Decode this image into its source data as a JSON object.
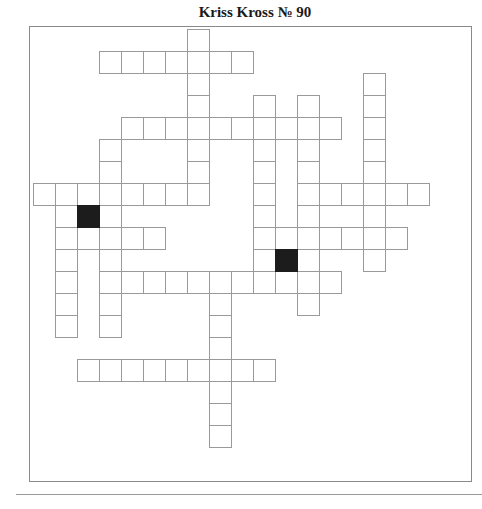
{
  "puzzle": {
    "title": "Kriss Kross № 90",
    "grid": {
      "origin_x": 33,
      "origin_y": 29,
      "cell_size": 22,
      "cols": 18,
      "rows": 19
    },
    "entries": [
      {
        "direction": "down",
        "col": 7,
        "row": 0,
        "length": 8
      },
      {
        "direction": "across",
        "col": 3,
        "row": 1,
        "length": 7
      },
      {
        "direction": "down",
        "col": 15,
        "row": 2,
        "length": 9
      },
      {
        "direction": "down",
        "col": 10,
        "row": 3,
        "length": 9
      },
      {
        "direction": "down",
        "col": 12,
        "row": 3,
        "length": 10
      },
      {
        "direction": "across",
        "col": 4,
        "row": 4,
        "length": 10
      },
      {
        "direction": "down",
        "col": 3,
        "row": 5,
        "length": 9
      },
      {
        "direction": "across",
        "col": 0,
        "row": 7,
        "length": 8
      },
      {
        "direction": "across",
        "col": 12,
        "row": 7,
        "length": 6
      },
      {
        "direction": "down",
        "col": 1,
        "row": 8,
        "length": 6
      },
      {
        "direction": "across",
        "col": 1,
        "row": 9,
        "length": 5
      },
      {
        "direction": "across",
        "col": 10,
        "row": 9,
        "length": 7
      },
      {
        "direction": "across",
        "col": 3,
        "row": 11,
        "length": 11
      },
      {
        "direction": "down",
        "col": 8,
        "row": 11,
        "length": 8
      },
      {
        "direction": "across",
        "col": 2,
        "row": 15,
        "length": 9
      }
    ],
    "blocks": [
      {
        "col": 2,
        "row": 8
      },
      {
        "col": 11,
        "row": 10
      }
    ],
    "colors": {
      "cell_border": "#9a9a9a",
      "block_fill": "#1c1c1c",
      "frame_border": "#8a8a8a",
      "background": "#ffffff"
    }
  }
}
